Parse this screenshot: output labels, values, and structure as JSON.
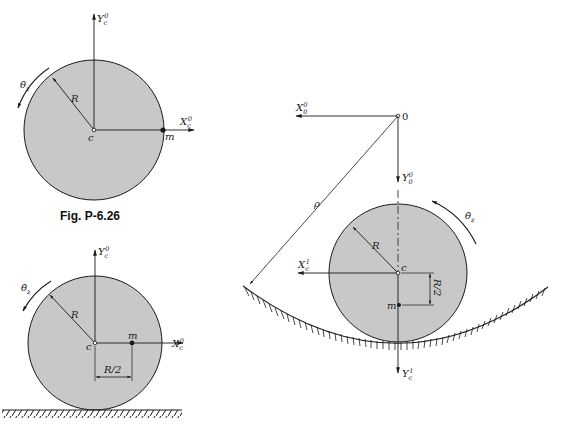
{
  "colors": {
    "disc_fill": "#c8c8c8",
    "stroke": "#1a1a1a",
    "background": "#ffffff"
  },
  "figure_caption": "Fig. P-6.26",
  "fig_a": {
    "y_axis": {
      "main": "Y",
      "sub": "c",
      "sup": "0"
    },
    "x_axis": {
      "main": "X",
      "sub": "c",
      "sup": "0"
    },
    "center_label": "c",
    "mass_label": "m",
    "radius_label": "R",
    "rate_label": {
      "main": "θ̇",
      "sub": "z"
    }
  },
  "fig_b": {
    "y_axis": {
      "main": "Y",
      "sub": "c",
      "sup": "0"
    },
    "x_axis": {
      "main": "X",
      "sub": "c",
      "sup": "0"
    },
    "center_label": "c",
    "mass_label": "m",
    "radius_label": "R",
    "offset_label": "R/2",
    "rate_label": {
      "main": "θ̇",
      "sub": "z"
    }
  },
  "fig_c": {
    "origin_label": "0",
    "x0_axis": {
      "main": "X",
      "sub": "0",
      "sup": "0"
    },
    "y0_axis": {
      "main": "Y",
      "sub": "0",
      "sup": "0"
    },
    "x1_axis": {
      "main": "X",
      "sub": "c",
      "sup": "1"
    },
    "y1_axis": {
      "main": "Y",
      "sub": "c",
      "sup": "1"
    },
    "center_label": "c",
    "mass_label": "m",
    "radius_label": "R",
    "offset_label": "R/2",
    "track_radius_label": "ρ",
    "rate_label": {
      "main": "θ̇",
      "sub": "z"
    }
  }
}
